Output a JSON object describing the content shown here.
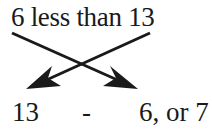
{
  "diagram": {
    "phrase": "6 less than 13",
    "result": {
      "left_operand": "13",
      "operator": "-",
      "right_operand": "6, or 7"
    },
    "arrows": [
      {
        "from": "6",
        "to": "6, or 7",
        "direction": "down-right"
      },
      {
        "from": "13",
        "to": "13",
        "direction": "down-left"
      }
    ],
    "colors": {
      "ink": "#1a1a1a",
      "background": "#ffffff"
    }
  }
}
